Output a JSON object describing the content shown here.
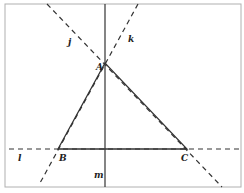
{
  "diagram": {
    "frame": {
      "x": 5,
      "y": 4,
      "w": 236,
      "h": 183,
      "stroke": "#b0b0b0"
    },
    "colors": {
      "line": "#333333"
    },
    "points": {
      "A": {
        "label": "A",
        "x": 105,
        "y": 63
      },
      "B": {
        "label": "B",
        "x": 58,
        "y": 149
      },
      "C": {
        "label": "C",
        "x": 187,
        "y": 149
      }
    },
    "lines": {
      "j": {
        "label": "j",
        "style": "dashed",
        "x1": 47,
        "y1": 4,
        "x2": 222,
        "y2": 187
      },
      "k": {
        "label": "k",
        "style": "dashed",
        "x1": 138,
        "y1": 4,
        "x2": 40,
        "y2": 183
      },
      "l": {
        "label": "l",
        "style": "dashed",
        "x1": 9,
        "y1": 149,
        "x2": 241,
        "y2": 149
      },
      "m": {
        "label": "m",
        "style": "solid",
        "x1": 105,
        "y1": 4,
        "x2": 105,
        "y2": 187
      }
    },
    "labels": {
      "j": "j",
      "k": "k",
      "l": "l",
      "m": "m",
      "A": "A",
      "B": "B",
      "C": "C"
    }
  }
}
